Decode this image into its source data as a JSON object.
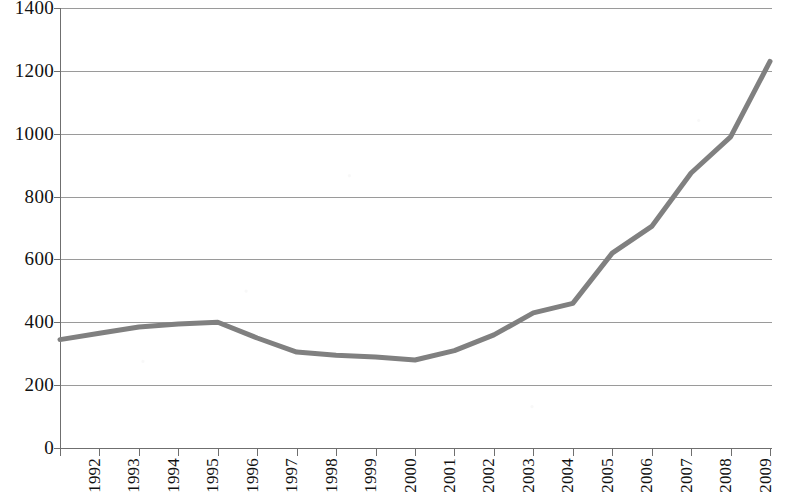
{
  "chart_data": {
    "type": "line",
    "title": "",
    "subtitle": "",
    "xlabel": "",
    "ylabel": "",
    "categories": [
      "1992",
      "1993",
      "1994",
      "1995",
      "1996",
      "1997",
      "1998",
      "1999",
      "2000",
      "2001",
      "2002",
      "2003",
      "2004",
      "2005",
      "2006",
      "2007",
      "2008",
      "2009",
      "2010"
    ],
    "values": [
      345,
      365,
      385,
      395,
      400,
      350,
      305,
      295,
      290,
      280,
      310,
      360,
      430,
      460,
      620,
      705,
      875,
      990,
      1230
    ],
    "series": [
      {
        "name": "series-1",
        "values": [
          345,
          365,
          385,
          395,
          400,
          350,
          305,
          295,
          290,
          280,
          310,
          360,
          430,
          460,
          620,
          705,
          875,
          990,
          1230
        ]
      }
    ],
    "ylim": [
      0,
      1400
    ],
    "y_ticks": [
      0,
      200,
      400,
      600,
      800,
      1000,
      1200,
      1400
    ],
    "y_tick_labels": [
      "0",
      "200",
      "400",
      "600",
      "800",
      "1000",
      "1200",
      "1400"
    ],
    "x_tick_labels": [
      "1992",
      "1993",
      "1994",
      "1995",
      "1996",
      "1997",
      "1998",
      "1999",
      "2000",
      "2001",
      "2002",
      "2003",
      "2004",
      "2005",
      "2006",
      "2007",
      "2008",
      "2009",
      "2010"
    ],
    "grid": true,
    "grid_axis": "y",
    "legend": false,
    "legend_position": "none",
    "line_color": "#808080",
    "line_width": 5,
    "grid_color": "#9a9a9a",
    "axis_color": "#6f6f6f",
    "background_color": "#ffffff",
    "annotations": []
  }
}
